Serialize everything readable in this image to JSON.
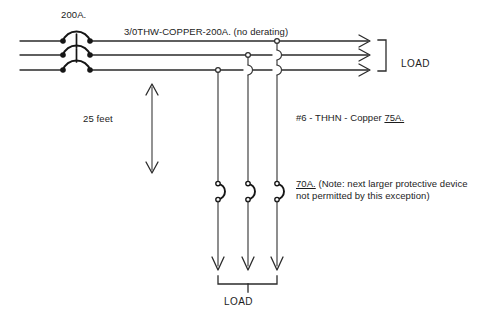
{
  "diagram": {
    "labels": {
      "main_breaker_rating": "200A.",
      "feeder_conductor": "3/0THW-COPPER-200A. (no derating)",
      "load_right": "LOAD",
      "tap_distance": "25 feet",
      "tap_conductor": "#6 - THHN - Copper ",
      "tap_conductor_ampacity": "75A.",
      "branch_device_rating": "70A.",
      "note_line1": " (Note: next larger protective device",
      "note_line2": "not permitted by this exception)",
      "load_bottom": "LOAD"
    },
    "colors": {
      "wire": "#2b2b2b",
      "device": "#161616",
      "text": "#1c1c1c",
      "background": "#ffffff"
    }
  }
}
